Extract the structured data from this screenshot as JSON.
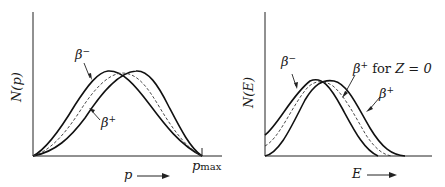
{
  "panels": [
    {
      "id": "momentum",
      "y_axis_label": "N(p)",
      "x_axis_label": "p",
      "x_arrow": "→",
      "endpoint_label_main": "p",
      "endpoint_label_sub": "max",
      "curves": [
        {
          "name": "β",
          "sign": "−",
          "style": "solid"
        },
        {
          "name": "β",
          "sign": "+",
          "style": "solid"
        },
        {
          "name": "Z=0 reference",
          "style": "dashed"
        }
      ]
    },
    {
      "id": "energy",
      "y_axis_label": "N(E)",
      "x_axis_label": "E",
      "x_arrow": "→",
      "curves": [
        {
          "name": "β",
          "sign": "−",
          "style": "solid"
        },
        {
          "name": "β",
          "sign": "+",
          "style": "solid"
        },
        {
          "name": "β",
          "sign": "+",
          "suffix": "for",
          "condition": "Z = 0",
          "style": "dashed"
        }
      ]
    }
  ],
  "colors": {
    "line": "#1a1a1a",
    "background": "#ffffff"
  }
}
